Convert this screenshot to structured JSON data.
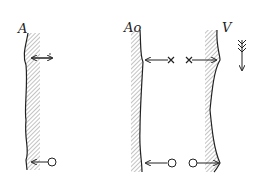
{
  "labels": {
    "panel_a": "A",
    "panel_ao": "Ao",
    "panel_v": "V"
  },
  "colors": {
    "ink": "#222222",
    "hatch": "#888888",
    "background": "#ffffff"
  },
  "markers": {
    "upper_left": "dot (·) with double arrow",
    "upper_middle": "× with arrow to left wall",
    "upper_right": "× with arrow to right wall",
    "lower_left": "○ with arrow to wall",
    "lower_middle": "○ with arrow to left wall",
    "lower_right": "○ with arrow to right wall"
  },
  "flow_indicator": "downward feathered arrow"
}
